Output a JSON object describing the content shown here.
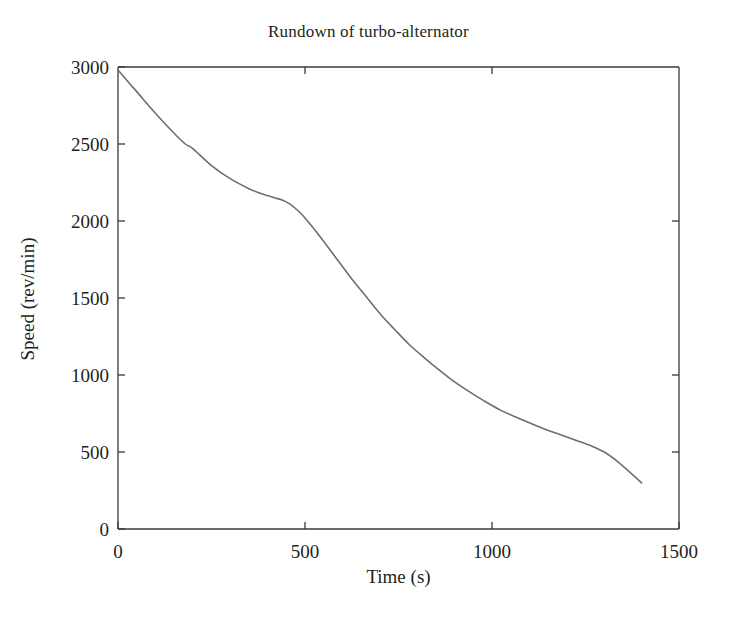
{
  "figure": {
    "background_color": "#ffffff",
    "text_color": "#231f20"
  },
  "chart_data": {
    "type": "line",
    "title": "Rundown of turbo-alternator",
    "xlabel": "Time (s)",
    "ylabel": "Speed (rev/min)",
    "xlim": [
      0,
      1500
    ],
    "ylim": [
      0,
      3000
    ],
    "xticks": [
      0,
      500,
      1000,
      1500
    ],
    "xtick_labels": [
      "0",
      "500",
      "1000",
      "1500"
    ],
    "yticks": [
      0,
      500,
      1000,
      1500,
      2000,
      2500,
      3000
    ],
    "ytick_labels": [
      "0",
      "500",
      "1000",
      "1500",
      "2000",
      "2500",
      "3000"
    ],
    "grid": false,
    "legend": null,
    "line_color": "#6e6e6e",
    "line_width": 1.6,
    "series": [
      {
        "name": "Speed",
        "x": [
          0,
          50,
          100,
          150,
          180,
          200,
          250,
          300,
          350,
          380,
          400,
          420,
          440,
          460,
          480,
          500,
          540,
          580,
          620,
          660,
          700,
          740,
          780,
          820,
          860,
          900,
          940,
          980,
          1020,
          1060,
          1100,
          1140,
          1180,
          1220,
          1260,
          1300,
          1340,
          1400
        ],
        "y": [
          2980,
          2840,
          2700,
          2570,
          2500,
          2470,
          2360,
          2275,
          2210,
          2180,
          2165,
          2150,
          2135,
          2110,
          2070,
          2020,
          1900,
          1770,
          1640,
          1520,
          1400,
          1295,
          1195,
          1110,
          1030,
          955,
          890,
          830,
          775,
          730,
          690,
          650,
          615,
          580,
          545,
          500,
          430,
          300
        ]
      }
    ]
  },
  "axes": {
    "spine_color": "#3a3a3a",
    "tick_length": 7
  }
}
